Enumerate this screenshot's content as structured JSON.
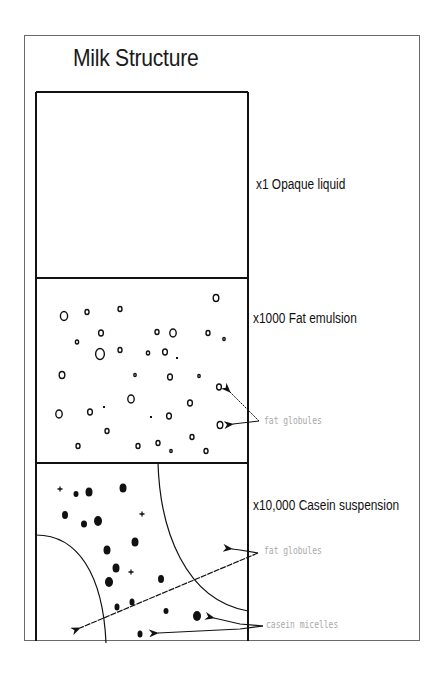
{
  "title": "Milk Structure",
  "colors": {
    "ink": "#111111",
    "frame": "#6a6a6a",
    "annotation": "#a8a8a8",
    "background": "#ffffff"
  },
  "sections": [
    {
      "id": "opaque",
      "label": "x1 Opaque liquid",
      "magnification": "x1"
    },
    {
      "id": "fat-emulsion",
      "label": "x1000 Fat emulsion",
      "magnification": "x1000",
      "annotations": [
        "fat globules"
      ]
    },
    {
      "id": "casein-suspension",
      "label": "x10,000 Casein suspension",
      "magnification": "x10,000",
      "annotations": [
        "fat globules",
        "casein micelles"
      ]
    }
  ],
  "fat_globules_x1000": [
    [
      64,
      316,
      4.5
    ],
    [
      87,
      312,
      2.5
    ],
    [
      120,
      309,
      2.5
    ],
    [
      101,
      333,
      3
    ],
    [
      77,
      342,
      2
    ],
    [
      100,
      354,
      5.5
    ],
    [
      120,
      350,
      2.5
    ],
    [
      62,
      375,
      3.5
    ],
    [
      135,
      375,
      1.5
    ],
    [
      131,
      399,
      4
    ],
    [
      59,
      414,
      4
    ],
    [
      90,
      412,
      3
    ],
    [
      107,
      431,
      2.5
    ],
    [
      78,
      446,
      2.5
    ],
    [
      138,
      446,
      2.5
    ],
    [
      216,
      298,
      3.5
    ],
    [
      157,
      332,
      2.5
    ],
    [
      173,
      333,
      4
    ],
    [
      208,
      333,
      2.5
    ],
    [
      224,
      339,
      1.5
    ],
    [
      148,
      353,
      2
    ],
    [
      165,
      352,
      3
    ],
    [
      170,
      377,
      3
    ],
    [
      199,
      376,
      1.5
    ],
    [
      219,
      387,
      3
    ],
    [
      190,
      403,
      3
    ],
    [
      169,
      416,
      3
    ],
    [
      220,
      425,
      3.5
    ],
    [
      192,
      437,
      2.5
    ],
    [
      158,
      443,
      2.5
    ],
    [
      171,
      451,
      1.5
    ],
    [
      206,
      451,
      2.5
    ]
  ],
  "fat_dots_x1000": [
    [
      104,
      407
    ],
    [
      177,
      358
    ],
    [
      151,
      417
    ]
  ],
  "casein_micelles_x10000": [
    [
      76,
      494,
      2.5,
      3
    ],
    [
      89,
      492,
      3.5,
      4.5
    ],
    [
      123,
      488,
      3.5,
      4.5
    ],
    [
      65,
      515,
      3,
      4
    ],
    [
      84,
      524,
      3,
      3.5
    ],
    [
      98,
      521,
      4,
      5
    ],
    [
      135,
      542,
      3.5,
      4.5
    ],
    [
      107,
      550,
      3.5,
      4.5
    ],
    [
      109,
      582,
      4,
      5
    ],
    [
      117,
      607,
      2.5,
      3.5
    ],
    [
      132,
      602,
      2.5,
      3.5
    ],
    [
      140,
      634,
      2.5,
      3.5
    ],
    [
      161,
      579,
      3,
      4
    ],
    [
      166,
      611,
      2.5,
      3
    ],
    [
      197,
      616,
      4,
      5
    ],
    [
      116,
      568,
      3.5,
      4.5
    ]
  ],
  "casein_stars_x10000": [
    [
      60,
      489
    ],
    [
      142,
      514
    ],
    [
      131,
      572
    ]
  ]
}
